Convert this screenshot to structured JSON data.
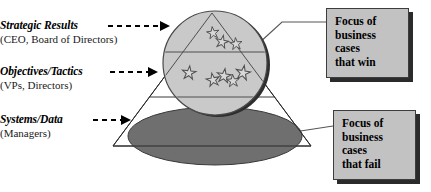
{
  "diagram": {
    "background_color": "#ffffff",
    "colors": {
      "circle_fill": "#c9c9c9",
      "circle_stroke": "#4a4a4a",
      "circle_shadow": "#2e2e2e",
      "ellipse_fill": "#6f6f6f",
      "ellipse_stroke": "#3a3a3a",
      "triangle_stroke": "#2b2b2b",
      "callout_fill": "#c2c2c2",
      "callout_border": "#3d3d3d",
      "callout_shadow": "#2b2b2b",
      "star_fill": "#d4d4d4",
      "star_stroke": "#555555",
      "text": "#000000"
    },
    "tiers": [
      {
        "name": "strategic-results",
        "title": "Strategic Results",
        "subtitle": "(CEO, Board of Directors)",
        "arrow": "dashed-arrow-right",
        "dash_count": 6
      },
      {
        "name": "objectives-tactics",
        "title": "Objectives/Tactics",
        "subtitle": "(VPs, Directors)",
        "arrow": "dashed-arrow-right",
        "dash_count": 5
      },
      {
        "name": "systems-data",
        "title": "Systems/Data",
        "subtitle": "(Managers)",
        "arrow": "dashed-arrow-right",
        "dash_count": 4
      }
    ],
    "callouts": [
      {
        "name": "callout-win",
        "lines": [
          "Focus of",
          "business",
          "cases",
          "that win"
        ],
        "connector": "circle-to-box"
      },
      {
        "name": "callout-fail",
        "lines": [
          "Focus of",
          "business",
          "cases",
          "that fail"
        ],
        "connector": "ellipse-to-box"
      }
    ],
    "stars": {
      "upper_zone_count": 3,
      "middle_zone_count": 5,
      "upper_positions": [
        {
          "x": 213,
          "y": 33,
          "r": 6.5,
          "rot": -8
        },
        {
          "x": 222,
          "y": 42,
          "r": 6.8,
          "rot": 12
        },
        {
          "x": 235,
          "y": 44,
          "r": 6.5,
          "rot": -5
        }
      ],
      "middle_positions": [
        {
          "x": 189,
          "y": 73,
          "r": 7.2,
          "rot": 6
        },
        {
          "x": 213,
          "y": 80,
          "r": 7.0,
          "rot": -10
        },
        {
          "x": 224,
          "y": 76,
          "r": 7.4,
          "rot": 8
        },
        {
          "x": 233,
          "y": 81,
          "r": 6.8,
          "rot": -4
        },
        {
          "x": 242,
          "y": 73,
          "r": 7.6,
          "rot": 10
        }
      ]
    },
    "shapes": {
      "triangle_apex": {
        "x": 212,
        "y": 13
      },
      "triangle_left": {
        "x": 113,
        "y": 146
      },
      "triangle_right": {
        "x": 311,
        "y": 146
      },
      "divider_1_y": 52,
      "divider_2_y": 97,
      "circle": {
        "cx": 215,
        "cy": 63,
        "r": 52
      },
      "ellipse": {
        "cx": 215,
        "cy": 136,
        "rx": 87,
        "ry": 29
      }
    }
  }
}
